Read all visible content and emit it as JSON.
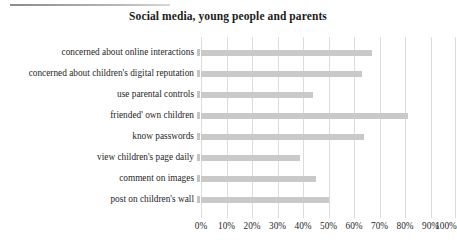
{
  "figure": {
    "title": "Social media, young people and parents",
    "decorations": {
      "top_rule": "horizontal-rule"
    }
  },
  "axis": {
    "x_ticks": [
      "0%",
      "10%",
      "20%",
      "30%",
      "40%",
      "50%",
      "60%",
      "70%",
      "80%",
      "90%",
      "100%"
    ]
  },
  "colors": {
    "bar": "#c9c9c9",
    "gridline": "#dcdcdc",
    "title": "#1b1b1b",
    "label": "#262626",
    "background": "#ffffff"
  },
  "chart_data": {
    "type": "bar",
    "orientation": "horizontal",
    "title": "Social media, young people and parents",
    "xlabel": "",
    "ylabel": "",
    "xlim": [
      0,
      100
    ],
    "x_unit": "%",
    "grid": true,
    "legend": false,
    "legend_position": "none",
    "categories": [
      "concerned about online interactions",
      "concerned about children's digital reputation",
      "use parental controls",
      "friended' own children",
      "know passwords",
      "view children's page daily",
      "comment on images",
      "post on children's wall"
    ],
    "values": [
      67,
      63,
      44,
      81,
      64,
      39,
      45,
      50
    ],
    "tick_labels": [
      "0%",
      "10%",
      "20%",
      "30%",
      "40%",
      "50%",
      "60%",
      "70%",
      "80%",
      "90%",
      "100%"
    ],
    "tick_values": [
      0,
      10,
      20,
      30,
      40,
      50,
      60,
      70,
      80,
      90,
      100
    ]
  }
}
